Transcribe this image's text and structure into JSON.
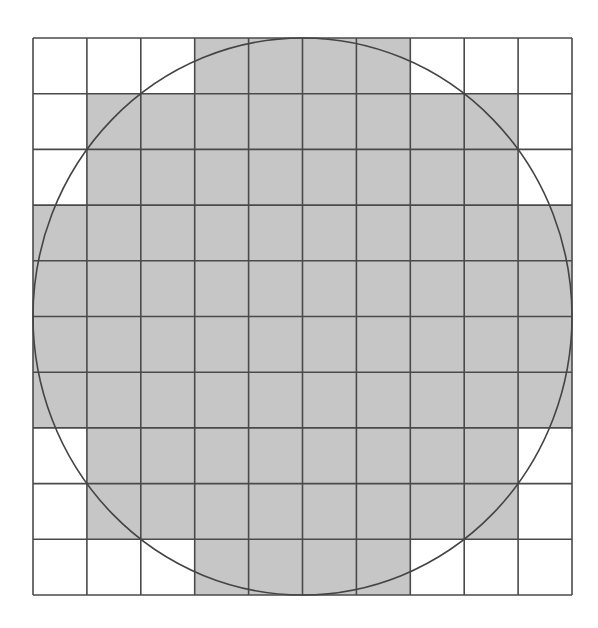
{
  "diagram": {
    "grid": {
      "rows": 10,
      "cols": 10,
      "x": 33,
      "y": 38,
      "width": 539,
      "height": 557
    },
    "colors": {
      "background": "#ffffff",
      "shade": "#c6c6c6",
      "grid_line": "#4a4a4a",
      "circle": "#444444"
    },
    "shaded_ranges": [
      {
        "row": 0,
        "from_col": 3,
        "to_col": 6
      },
      {
        "row": 1,
        "from_col": 1,
        "to_col": 8
      },
      {
        "row": 2,
        "from_col": 1,
        "to_col": 8
      },
      {
        "row": 3,
        "from_col": 0,
        "to_col": 9
      },
      {
        "row": 4,
        "from_col": 0,
        "to_col": 9
      },
      {
        "row": 5,
        "from_col": 0,
        "to_col": 9
      },
      {
        "row": 6,
        "from_col": 0,
        "to_col": 9
      },
      {
        "row": 7,
        "from_col": 1,
        "to_col": 8
      },
      {
        "row": 8,
        "from_col": 1,
        "to_col": 8
      },
      {
        "row": 9,
        "from_col": 3,
        "to_col": 6
      }
    ],
    "shaded_cell_count": 76,
    "circle": {
      "shape": "circle inscribed in grid"
    }
  }
}
